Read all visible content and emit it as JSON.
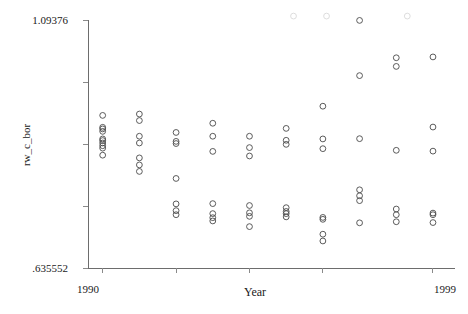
{
  "chart_data": {
    "type": "scatter",
    "title": "",
    "xlabel": "Year",
    "ylabel": "rw_c_bor",
    "xlim": [
      1989.6,
      1999.6
    ],
    "ylim": [
      0.635552,
      1.09376
    ],
    "grid": false,
    "legend": null,
    "x_ticks": [
      1990,
      1992,
      1994,
      1996,
      1999
    ],
    "x_tick_labels": [
      "1990",
      "",
      "",
      "",
      "1999"
    ],
    "y_ticks": [
      0.635552,
      0.749,
      0.8635,
      0.9782,
      1.09376
    ],
    "y_tick_labels": [
      ".635552",
      "",
      "",
      "",
      "1.09376"
    ],
    "marker": "open-circle",
    "marker_color": "#4a4a4a",
    "points": [
      {
        "x": 1990,
        "y": 0.9175
      },
      {
        "x": 1990,
        "y": 0.8955
      },
      {
        "x": 1990,
        "y": 0.8925
      },
      {
        "x": 1990,
        "y": 0.888
      },
      {
        "x": 1990,
        "y": 0.874
      },
      {
        "x": 1990,
        "y": 0.871
      },
      {
        "x": 1990,
        "y": 0.8665
      },
      {
        "x": 1990,
        "y": 0.8615
      },
      {
        "x": 1990,
        "y": 0.857
      },
      {
        "x": 1990,
        "y": 0.844
      },
      {
        "x": 1991,
        "y": 0.92
      },
      {
        "x": 1991,
        "y": 0.908
      },
      {
        "x": 1991,
        "y": 0.879
      },
      {
        "x": 1991,
        "y": 0.8665
      },
      {
        "x": 1991,
        "y": 0.839
      },
      {
        "x": 1991,
        "y": 0.826
      },
      {
        "x": 1991,
        "y": 0.814
      },
      {
        "x": 1992,
        "y": 0.886
      },
      {
        "x": 1992,
        "y": 0.8695
      },
      {
        "x": 1992,
        "y": 0.8655
      },
      {
        "x": 1992,
        "y": 0.801
      },
      {
        "x": 1992,
        "y": 0.754
      },
      {
        "x": 1992,
        "y": 0.7415
      },
      {
        "x": 1992,
        "y": 0.734
      },
      {
        "x": 1993,
        "y": 0.903
      },
      {
        "x": 1993,
        "y": 0.879
      },
      {
        "x": 1993,
        "y": 0.851
      },
      {
        "x": 1993,
        "y": 0.7545
      },
      {
        "x": 1993,
        "y": 0.736
      },
      {
        "x": 1993,
        "y": 0.7285
      },
      {
        "x": 1993,
        "y": 0.7225
      },
      {
        "x": 1994,
        "y": 0.879
      },
      {
        "x": 1994,
        "y": 0.858
      },
      {
        "x": 1994,
        "y": 0.8425
      },
      {
        "x": 1994,
        "y": 0.751
      },
      {
        "x": 1994,
        "y": 0.7375
      },
      {
        "x": 1994,
        "y": 0.731
      },
      {
        "x": 1994,
        "y": 0.712
      },
      {
        "x": 1995,
        "y": 0.8935
      },
      {
        "x": 1995,
        "y": 0.8715
      },
      {
        "x": 1995,
        "y": 0.864
      },
      {
        "x": 1995,
        "y": 0.747
      },
      {
        "x": 1995,
        "y": 0.74
      },
      {
        "x": 1995,
        "y": 0.736
      },
      {
        "x": 1995,
        "y": 0.73
      },
      {
        "x": 1996,
        "y": 0.9345
      },
      {
        "x": 1996,
        "y": 0.874
      },
      {
        "x": 1996,
        "y": 0.856
      },
      {
        "x": 1996,
        "y": 0.729
      },
      {
        "x": 1996,
        "y": 0.7255
      },
      {
        "x": 1996,
        "y": 0.698
      },
      {
        "x": 1996,
        "y": 0.6855
      },
      {
        "x": 1997,
        "y": 1.093
      },
      {
        "x": 1997,
        "y": 0.991
      },
      {
        "x": 1997,
        "y": 0.8745
      },
      {
        "x": 1997,
        "y": 0.78
      },
      {
        "x": 1997,
        "y": 0.769
      },
      {
        "x": 1997,
        "y": 0.76
      },
      {
        "x": 1997,
        "y": 0.719
      },
      {
        "x": 1998,
        "y": 1.024
      },
      {
        "x": 1998,
        "y": 1.008
      },
      {
        "x": 1998,
        "y": 0.853
      },
      {
        "x": 1998,
        "y": 0.7445
      },
      {
        "x": 1998,
        "y": 0.734
      },
      {
        "x": 1998,
        "y": 0.721
      },
      {
        "x": 1999,
        "y": 1.0255
      },
      {
        "x": 1999,
        "y": 0.896
      },
      {
        "x": 1999,
        "y": 0.8515
      },
      {
        "x": 1999,
        "y": 0.737
      },
      {
        "x": 1999,
        "y": 0.734
      },
      {
        "x": 1999,
        "y": 0.7195
      }
    ],
    "clipped_points": [
      {
        "x": 1995.2,
        "y": 1.101
      },
      {
        "x": 1996.1,
        "y": 1.101
      },
      {
        "x": 1998.3,
        "y": 1.101
      }
    ]
  },
  "axes": {
    "y_max_label": "1.09376",
    "y_min_label": ".635552",
    "x_min_label": "1990",
    "x_max_label": "1999",
    "x_title": "Year",
    "y_title": "rw_c_bor"
  }
}
